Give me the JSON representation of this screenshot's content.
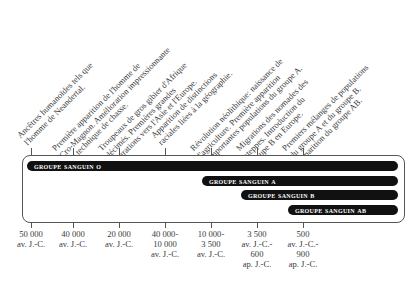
{
  "annotations": [
    {
      "lines": [
        "Ancêtres humanoïdes tels que",
        "l'homme de Neandertal."
      ]
    },
    {
      "lines": [
        "Première apparition de l'homme de",
        "Cro-Magnon. Amélioration impressionnante",
        "des technique de chasse."
      ]
    },
    {
      "lines": [
        "Troupeaux de gros gibier d'Afrique",
        "décimés. Premières grandes",
        "migrations vers l'Asie et l'Europe."
      ]
    },
    {
      "lines": [
        "Apparition de distinctions",
        "raciales liées à la géographie."
      ]
    },
    {
      "lines": [
        "Révolution néolithique: naissance de",
        "l'agriculture. Première apparition",
        "d'importantes populations du groupe A."
      ]
    },
    {
      "lines": [
        "Migrations des nomades des",
        "steppes. Introduction du",
        "groupe B en Europe."
      ]
    },
    {
      "lines": [
        "Premiers mélanges de populations",
        "du groupe A et du groupe B.",
        "Apparition du groupe AB."
      ]
    }
  ],
  "bars": [
    {
      "label": "Groupe sanguin O",
      "start_index": 0
    },
    {
      "label": "Groupe sanguin A",
      "start_index": 4
    },
    {
      "label": "Groupe sanguin B",
      "start_index": 5
    },
    {
      "label": "Groupe sanguin AB",
      "start_index": 6
    }
  ],
  "dates": [
    {
      "lines": [
        "50 000",
        "av. J.-C."
      ]
    },
    {
      "lines": [
        "40 000",
        "av. J.-C."
      ]
    },
    {
      "lines": [
        "20 000",
        "av. J.-C."
      ]
    },
    {
      "lines": [
        "40 000-",
        "10 000",
        "av. J.-C."
      ]
    },
    {
      "lines": [
        "10 000-",
        "3 500",
        "av. J.-C."
      ]
    },
    {
      "lines": [
        "3 500",
        "av. J.-C.-",
        "600",
        "ap. J.-C."
      ]
    },
    {
      "lines": [
        "500",
        "av. J.-C.-",
        "900",
        "ap. J.-C."
      ]
    }
  ],
  "colors": {
    "bar": "#111111",
    "bar_text": "#ffffff",
    "frame": "#555555",
    "text": "#3a3a3a"
  }
}
